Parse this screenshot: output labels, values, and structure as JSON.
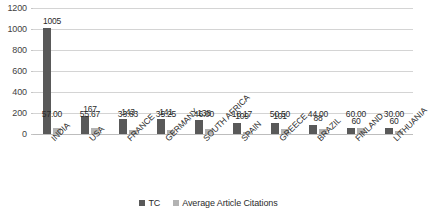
{
  "chart_data": {
    "type": "bar",
    "title": "",
    "subtitle": "",
    "xlabel": "",
    "ylabel": "",
    "ylim": [
      0,
      1200
    ],
    "ytick_step": 200,
    "yticks": [
      "0",
      "200",
      "400",
      "600",
      "800",
      "1000",
      "1200"
    ],
    "grid": true,
    "legend_position": "bottom",
    "categories": [
      "INDIA",
      "USA",
      "FRANCE",
      "GERMANY",
      "SOUTH AFRICA",
      "SPAIN",
      "GREECE",
      "BRAZIL",
      "FINLAND",
      "LITHUANIA"
    ],
    "series": [
      {
        "name": "TC",
        "color": "#595959",
        "values": [
          1005,
          167,
          143,
          141,
          138,
          109,
          101,
          88,
          60,
          60
        ],
        "labels": [
          "1005",
          "167",
          "143",
          "141",
          "138",
          "109",
          "101",
          "88",
          "60",
          "60"
        ]
      },
      {
        "name": "Average Article Citations",
        "color": "#b3b3b3",
        "values": [
          57.0,
          55.67,
          33.83,
          35.25,
          46.0,
          18.17,
          50.5,
          44.0,
          60.0,
          30.0
        ],
        "labels": [
          "57.00",
          "55.67",
          "33.83",
          "35.25",
          "46.00",
          "18.17",
          "50.50",
          "44.00",
          "60.00",
          "30.00"
        ]
      }
    ]
  },
  "legend": {
    "items": [
      {
        "label": "TC",
        "color": "#595959"
      },
      {
        "label": "Average Article Citations",
        "color": "#b3b3b3"
      }
    ]
  }
}
